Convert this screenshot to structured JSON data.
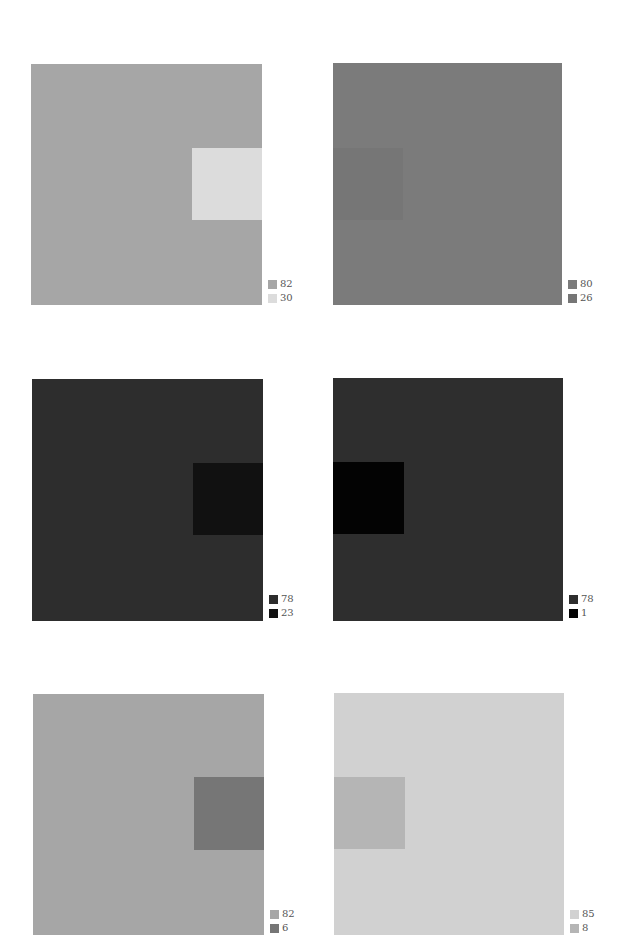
{
  "panels": [
    {
      "id": "top-left",
      "outer": {
        "x": 31,
        "y": 64,
        "w": 231,
        "h": 241,
        "color": "#a6a6a6"
      },
      "inner": {
        "x": 192,
        "y": 148,
        "w": 70,
        "h": 72,
        "color": "#dcdcdc"
      },
      "legend": {
        "x": 268,
        "y": 277,
        "items": [
          {
            "label": "82",
            "color": "#a6a6a6"
          },
          {
            "label": "30",
            "color": "#dcdcdc"
          }
        ]
      }
    },
    {
      "id": "top-right",
      "outer": {
        "x": 333,
        "y": 63,
        "w": 229,
        "h": 242,
        "color": "#7b7b7b"
      },
      "inner": {
        "x": 333,
        "y": 148,
        "w": 70,
        "h": 72,
        "color": "#767676"
      },
      "legend": {
        "x": 568,
        "y": 277,
        "items": [
          {
            "label": "80",
            "color": "#7b7b7b"
          },
          {
            "label": "26",
            "color": "#767676"
          }
        ]
      }
    },
    {
      "id": "middle-left",
      "outer": {
        "x": 32,
        "y": 379,
        "w": 231,
        "h": 242,
        "color": "#2d2d2d"
      },
      "inner": {
        "x": 193,
        "y": 463,
        "w": 70,
        "h": 72,
        "color": "#111111"
      },
      "legend": {
        "x": 269,
        "y": 592,
        "items": [
          {
            "label": "78",
            "color": "#2d2d2d"
          },
          {
            "label": "23",
            "color": "#111111"
          }
        ]
      }
    },
    {
      "id": "middle-right",
      "outer": {
        "x": 333,
        "y": 378,
        "w": 230,
        "h": 243,
        "color": "#2e2e2e"
      },
      "inner": {
        "x": 333,
        "y": 462,
        "w": 71,
        "h": 72,
        "color": "#030303"
      },
      "legend": {
        "x": 569,
        "y": 592,
        "items": [
          {
            "label": "78",
            "color": "#2e2e2e"
          },
          {
            "label": "1",
            "color": "#030303"
          }
        ]
      }
    },
    {
      "id": "bottom-left",
      "outer": {
        "x": 33,
        "y": 694,
        "w": 231,
        "h": 241,
        "color": "#a6a6a6"
      },
      "inner": {
        "x": 194,
        "y": 777,
        "w": 70,
        "h": 73,
        "color": "#767676"
      },
      "legend": {
        "x": 270,
        "y": 907,
        "items": [
          {
            "label": "82",
            "color": "#a6a6a6"
          },
          {
            "label": "6",
            "color": "#767676"
          }
        ]
      }
    },
    {
      "id": "bottom-right",
      "outer": {
        "x": 334,
        "y": 693,
        "w": 230,
        "h": 242,
        "color": "#d1d1d1"
      },
      "inner": {
        "x": 334,
        "y": 777,
        "w": 71,
        "h": 72,
        "color": "#b5b5b5"
      },
      "legend": {
        "x": 570,
        "y": 907,
        "items": [
          {
            "label": "85",
            "color": "#d1d1d1"
          },
          {
            "label": "8",
            "color": "#b5b5b5"
          }
        ]
      }
    }
  ]
}
